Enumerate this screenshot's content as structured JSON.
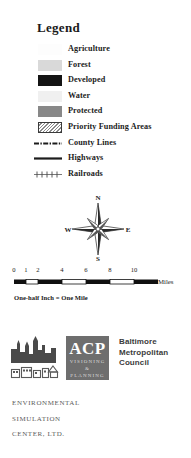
{
  "legend": {
    "title": "Legend",
    "area_items": [
      {
        "label": "Agriculture",
        "swatch": "area-swatch-agriculture",
        "color": "#fdfdfd"
      },
      {
        "label": "Forest",
        "swatch": "area-swatch-forest",
        "color": "#d9d9d9"
      },
      {
        "label": "Developed",
        "swatch": "area-swatch-developed",
        "color": "#141414"
      },
      {
        "label": "Water",
        "swatch": "area-swatch-water",
        "color": "#f0f0f0"
      },
      {
        "label": "Protected",
        "swatch": "area-swatch-protected",
        "color": "#888888"
      },
      {
        "label": "Priority Funding Areas",
        "swatch": "area-swatch-priority-funding-areas",
        "color": "#ffffff",
        "pattern": "diagonal-hatch"
      }
    ],
    "line_items": [
      {
        "label": "County Lines",
        "swatch": "line-swatch-county-lines",
        "style": "dash-dot",
        "color": "#1c1c1c"
      },
      {
        "label": "Highways",
        "swatch": "line-swatch-highways",
        "style": "solid",
        "color": "#1c1c1c"
      },
      {
        "label": "Railroads",
        "swatch": "line-swatch-railroads",
        "style": "crosstie",
        "color": "#5a5a5a"
      }
    ]
  },
  "compass": {
    "north": "N",
    "east": "E",
    "south": "S",
    "west": "W"
  },
  "scale": {
    "ticks": [
      "0",
      "1",
      "2",
      "4",
      "6",
      "8",
      "10"
    ],
    "tick_positions": [
      14,
      26,
      38,
      62,
      86,
      110,
      134
    ],
    "unit_label": "Miles",
    "equivalence": "One-half Inch = One Mile"
  },
  "credits": {
    "acp": {
      "initials": "ACP",
      "line1": "VISIONING",
      "line2": "&",
      "line3": "PLANNING"
    },
    "bmc": {
      "line1": "Baltimore",
      "line2": "Metropolitan",
      "line3": "Council"
    },
    "esc": {
      "line1": "ENVIRONMENTAL",
      "line2": "SIMULATION",
      "line3": "CENTER, LTD."
    }
  }
}
